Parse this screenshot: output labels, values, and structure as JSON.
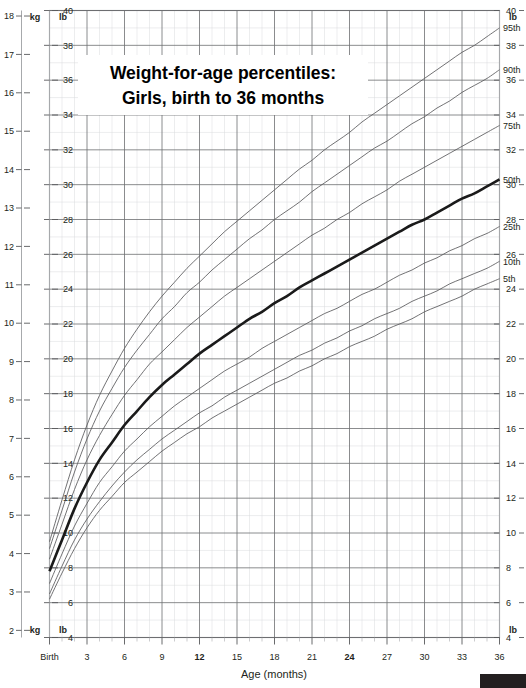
{
  "chart_data": {
    "type": "line",
    "title": "Weight-for-age percentiles:",
    "subtitle": "Girls, birth to 36 months",
    "xlabel": "Age (months)",
    "ylabel_left_primary": "kg",
    "ylabel_left_secondary": "lb",
    "ylabel_right_primary": "lb",
    "grid": true,
    "legend_position": "right-inline",
    "xlim": [
      0,
      36
    ],
    "x": [
      0,
      1,
      2,
      3,
      4,
      5,
      6,
      7,
      8,
      9,
      10,
      11,
      12,
      13,
      14,
      15,
      16,
      17,
      18,
      19,
      20,
      21,
      22,
      23,
      24,
      25,
      26,
      27,
      28,
      29,
      30,
      31,
      32,
      33,
      34,
      35,
      36
    ],
    "x_ticks": [
      "Birth",
      "3",
      "6",
      "9",
      "12",
      "15",
      "18",
      "21",
      "24",
      "27",
      "30",
      "33",
      "36"
    ],
    "x_ticks_bold": [
      "12",
      "24"
    ],
    "x_tick_values": [
      0,
      3,
      6,
      9,
      12,
      15,
      18,
      21,
      24,
      27,
      30,
      33,
      36
    ],
    "ylim_lb": [
      4,
      40
    ],
    "y_ticks_lb": [
      4,
      6,
      8,
      10,
      12,
      14,
      16,
      18,
      20,
      22,
      24,
      26,
      28,
      30,
      32,
      34,
      36,
      38,
      40
    ],
    "ylim_kg": [
      2,
      18
    ],
    "y_ticks_kg": [
      2,
      3,
      4,
      5,
      6,
      7,
      8,
      9,
      10,
      11,
      12,
      13,
      14,
      15,
      16,
      17,
      18
    ],
    "units": {
      "left_outer": "kg",
      "left_inner": "lb",
      "right": "lb"
    },
    "series": [
      {
        "name": "95th",
        "label": "95th",
        "unit": "lb",
        "values": [
          9.5,
          11.9,
          14.2,
          16.2,
          17.9,
          19.3,
          20.6,
          21.7,
          22.7,
          23.6,
          24.4,
          25.2,
          25.9,
          26.6,
          27.3,
          27.9,
          28.5,
          29.1,
          29.7,
          30.3,
          30.9,
          31.4,
          32.0,
          32.5,
          33.0,
          33.6,
          34.1,
          34.6,
          35.1,
          35.6,
          36.1,
          36.6,
          37.1,
          37.6,
          38.0,
          38.5,
          39.0
        ]
      },
      {
        "name": "90th",
        "label": "90th",
        "unit": "lb",
        "values": [
          9.1,
          11.3,
          13.5,
          15.4,
          17.0,
          18.3,
          19.5,
          20.5,
          21.4,
          22.3,
          23.0,
          23.8,
          24.4,
          25.1,
          25.7,
          26.3,
          26.9,
          27.4,
          28.0,
          28.5,
          29.0,
          29.6,
          30.1,
          30.6,
          31.1,
          31.6,
          32.1,
          32.5,
          33.0,
          33.5,
          33.9,
          34.4,
          34.8,
          35.3,
          35.7,
          36.1,
          36.6
        ]
      },
      {
        "name": "75th",
        "label": "75th",
        "unit": "lb",
        "values": [
          8.5,
          10.5,
          12.5,
          14.2,
          15.6,
          16.8,
          17.9,
          18.8,
          19.7,
          20.4,
          21.1,
          21.8,
          22.4,
          23.0,
          23.6,
          24.1,
          24.6,
          25.1,
          25.6,
          26.1,
          26.6,
          27.1,
          27.5,
          28.0,
          28.4,
          28.9,
          29.3,
          29.7,
          30.2,
          30.6,
          31.0,
          31.4,
          31.8,
          32.2,
          32.6,
          33.0,
          33.4
        ]
      },
      {
        "name": "50th",
        "label": "50th",
        "unit": "lb",
        "values": [
          7.8,
          9.6,
          11.4,
          12.9,
          14.2,
          15.2,
          16.2,
          17.0,
          17.8,
          18.5,
          19.1,
          19.7,
          20.3,
          20.8,
          21.3,
          21.8,
          22.3,
          22.7,
          23.2,
          23.6,
          24.1,
          24.5,
          24.9,
          25.3,
          25.7,
          26.1,
          26.5,
          26.9,
          27.3,
          27.7,
          28.0,
          28.4,
          28.8,
          29.2,
          29.5,
          29.9,
          30.3
        ]
      },
      {
        "name": "25th",
        "label": "25th",
        "unit": "lb",
        "values": [
          7.1,
          8.8,
          10.4,
          11.7,
          12.9,
          13.8,
          14.7,
          15.4,
          16.1,
          16.7,
          17.3,
          17.8,
          18.3,
          18.8,
          19.3,
          19.7,
          20.1,
          20.6,
          21.0,
          21.4,
          21.8,
          22.2,
          22.6,
          22.9,
          23.3,
          23.7,
          24.0,
          24.4,
          24.8,
          25.1,
          25.5,
          25.8,
          26.2,
          26.5,
          26.9,
          27.2,
          27.6
        ]
      },
      {
        "name": "10th",
        "label": "10th",
        "unit": "lb",
        "values": [
          6.5,
          8.1,
          9.6,
          10.8,
          11.8,
          12.7,
          13.5,
          14.2,
          14.8,
          15.4,
          15.9,
          16.4,
          16.9,
          17.3,
          17.8,
          18.2,
          18.6,
          19.0,
          19.4,
          19.8,
          20.2,
          20.5,
          20.9,
          21.2,
          21.6,
          21.9,
          22.3,
          22.6,
          22.9,
          23.3,
          23.6,
          23.9,
          24.3,
          24.6,
          24.9,
          25.2,
          25.6
        ]
      },
      {
        "name": "5th",
        "label": "5th",
        "unit": "lb",
        "values": [
          6.2,
          7.7,
          9.1,
          10.3,
          11.3,
          12.1,
          12.9,
          13.5,
          14.1,
          14.7,
          15.2,
          15.7,
          16.1,
          16.6,
          17.0,
          17.4,
          17.8,
          18.2,
          18.6,
          18.9,
          19.3,
          19.6,
          20.0,
          20.3,
          20.7,
          21.0,
          21.3,
          21.7,
          22.0,
          22.3,
          22.7,
          23.0,
          23.3,
          23.6,
          24.0,
          24.3,
          24.6
        ]
      }
    ],
    "colors": {
      "curve": "#58595b",
      "median_curve": "#1a1a1a",
      "grid_major": "#6d6e71",
      "grid_minor": "#d9dbdd",
      "text": "#231f20"
    }
  },
  "footer": {
    "logo_text": "CDC"
  }
}
